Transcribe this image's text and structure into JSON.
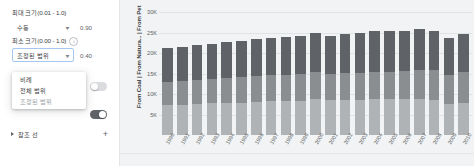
{
  "sidebar": {
    "max_size": {
      "label": "최대 크기(0.01 - 1.0)",
      "select_value": "수동",
      "caret": "▾",
      "number_value": "0.90"
    },
    "min_size": {
      "label": "최소 크기(0.00 - 1.0)",
      "info_icon": "i",
      "select_value": "조정된 범위",
      "caret": "▾",
      "number_value": "0.40"
    },
    "dropdown_menu": {
      "items": [
        {
          "label": "비례",
          "selected": false
        },
        {
          "label": "전체 범위",
          "selected": false
        },
        {
          "label": "조정된 범위",
          "selected": true
        }
      ]
    },
    "toggles": [
      {
        "name": "toggle-upper",
        "state": "off"
      },
      {
        "name": "toggle-lower",
        "state": "on"
      }
    ],
    "reference_line": {
      "title": "참조 선",
      "expand_icon": "▶",
      "add_icon": "+"
    }
  },
  "chart_data": {
    "type": "bar",
    "stacked": true,
    "title": "",
    "xlabel": "",
    "ylabel": "From Coal  |  From Natura...  |  From Pet",
    "ylim": [
      0,
      32000
    ],
    "grid": true,
    "legend": "none",
    "ytick_labels": [
      "30K",
      "25K",
      "20K",
      "15K",
      "10K",
      "5K"
    ],
    "ytick_values": [
      30000,
      25000,
      20000,
      15000,
      10000,
      5000
    ],
    "categories": [
      "1990",
      "1991",
      "1992",
      "1993",
      "1994",
      "1995",
      "1996",
      "1997",
      "1998",
      "1999",
      "2000",
      "2001",
      "2002",
      "2003",
      "2004",
      "2005",
      "2006",
      "2007",
      "2008",
      "2009",
      "2010"
    ],
    "series": [
      {
        "name": "From Coal",
        "color": "#b0b3b6",
        "values": [
          7400,
          7450,
          7500,
          7700,
          7800,
          7900,
          8100,
          8200,
          8300,
          8400,
          8700,
          8500,
          8500,
          8600,
          8700,
          8800,
          8700,
          8800,
          8600,
          7500,
          7900
        ]
      },
      {
        "name": "From Natural Gas",
        "color": "#8b8e91",
        "values": [
          5600,
          5700,
          5900,
          6000,
          6100,
          6300,
          6300,
          6400,
          6400,
          6500,
          6600,
          6400,
          6700,
          6600,
          6700,
          6700,
          6900,
          7200,
          7200,
          7100,
          7500
        ]
      },
      {
        "name": "From Petroleum",
        "color": "#5f6368",
        "values": [
          8300,
          8300,
          8500,
          8600,
          8800,
          8800,
          9100,
          9200,
          9200,
          9400,
          9600,
          9400,
          9500,
          9600,
          10000,
          10000,
          9900,
          9900,
          9500,
          9000,
          9200
        ]
      }
    ]
  }
}
